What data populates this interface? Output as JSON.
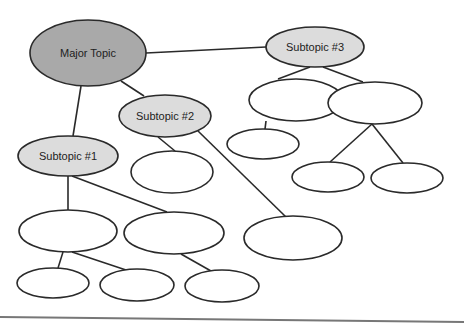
{
  "diagram": {
    "type": "concept-map",
    "colors": {
      "major_fill": "#a9a9a9",
      "subtopic_fill": "#dcdcdc",
      "empty_fill": "#ffffff",
      "stroke": "#2a2a2a",
      "rule": "#777777"
    },
    "nodes": [
      {
        "id": "major",
        "label": "Major Topic",
        "cx": 88,
        "cy": 53,
        "rx": 58,
        "ry": 33,
        "kind": "major"
      },
      {
        "id": "sub3",
        "label": "Subtopic #3",
        "cx": 315,
        "cy": 47,
        "rx": 49,
        "ry": 20,
        "kind": "subtopic"
      },
      {
        "id": "sub2",
        "label": "Subtopic #2",
        "cx": 165,
        "cy": 116,
        "rx": 46,
        "ry": 21,
        "kind": "subtopic"
      },
      {
        "id": "sub1",
        "label": "Subtopic #1",
        "cx": 68,
        "cy": 156,
        "rx": 50,
        "ry": 20,
        "kind": "subtopic"
      },
      {
        "id": "s3a",
        "label": "",
        "cx": 296,
        "cy": 100,
        "rx": 47,
        "ry": 21,
        "kind": "empty"
      },
      {
        "id": "s3b",
        "label": "",
        "cx": 375,
        "cy": 103,
        "rx": 47,
        "ry": 21,
        "kind": "empty"
      },
      {
        "id": "s3a1",
        "label": "",
        "cx": 263,
        "cy": 144,
        "rx": 36,
        "ry": 15,
        "kind": "empty"
      },
      {
        "id": "s3b1",
        "label": "",
        "cx": 328,
        "cy": 177,
        "rx": 36,
        "ry": 15,
        "kind": "empty"
      },
      {
        "id": "s3b2",
        "label": "",
        "cx": 407,
        "cy": 178,
        "rx": 36,
        "ry": 15,
        "kind": "empty"
      },
      {
        "id": "s2a",
        "label": "",
        "cx": 172,
        "cy": 172,
        "rx": 41,
        "ry": 21,
        "kind": "empty"
      },
      {
        "id": "s2b",
        "label": "",
        "cx": 293,
        "cy": 238,
        "rx": 49,
        "ry": 22,
        "kind": "empty"
      },
      {
        "id": "s1a",
        "label": "",
        "cx": 68,
        "cy": 231,
        "rx": 49,
        "ry": 21,
        "kind": "empty"
      },
      {
        "id": "s1b",
        "label": "",
        "cx": 174,
        "cy": 233,
        "rx": 50,
        "ry": 21,
        "kind": "empty"
      },
      {
        "id": "s1a1",
        "label": "",
        "cx": 53,
        "cy": 283,
        "rx": 36,
        "ry": 15,
        "kind": "empty"
      },
      {
        "id": "s1a2",
        "label": "",
        "cx": 137,
        "cy": 285,
        "rx": 37,
        "ry": 16,
        "kind": "empty"
      },
      {
        "id": "s1b1",
        "label": "",
        "cx": 222,
        "cy": 286,
        "rx": 37,
        "ry": 16,
        "kind": "empty"
      }
    ],
    "edges": [
      {
        "from": "major",
        "to": "sub3",
        "x1": 146,
        "y1": 53,
        "x2": 266,
        "y2": 47
      },
      {
        "from": "major",
        "to": "sub2",
        "x1": 121,
        "y1": 81,
        "x2": 144,
        "y2": 96
      },
      {
        "from": "major",
        "to": "sub1",
        "x1": 81,
        "y1": 86,
        "x2": 73,
        "y2": 136
      },
      {
        "from": "sub3",
        "to": "s3a",
        "x1": 310,
        "y1": 67,
        "x2": 278,
        "y2": 79
      },
      {
        "from": "sub3",
        "to": "s3b",
        "x1": 323,
        "y1": 67,
        "x2": 363,
        "y2": 82
      },
      {
        "from": "s3a",
        "to": "s3a1",
        "x1": 266,
        "y1": 121,
        "x2": 265,
        "y2": 129
      },
      {
        "from": "s3b",
        "to": "s3b1",
        "x1": 372,
        "y1": 124,
        "x2": 330,
        "y2": 162
      },
      {
        "from": "s3b",
        "to": "s3b2",
        "x1": 372,
        "y1": 124,
        "x2": 403,
        "y2": 163
      },
      {
        "from": "sub2",
        "to": "s2a",
        "x1": 158,
        "y1": 137,
        "x2": 175,
        "y2": 151
      },
      {
        "from": "sub2",
        "to": "s2b",
        "x1": 198,
        "y1": 131,
        "x2": 286,
        "y2": 217
      },
      {
        "from": "sub1",
        "to": "s1a",
        "x1": 68,
        "y1": 176,
        "x2": 68,
        "y2": 210
      },
      {
        "from": "sub1",
        "to": "s1b",
        "x1": 72,
        "y1": 176,
        "x2": 167,
        "y2": 212
      },
      {
        "from": "s1a",
        "to": "s1a1",
        "x1": 63,
        "y1": 252,
        "x2": 58,
        "y2": 268
      },
      {
        "from": "s1a",
        "to": "s1a2",
        "x1": 72,
        "y1": 252,
        "x2": 126,
        "y2": 270
      },
      {
        "from": "s1b",
        "to": "s1b1",
        "x1": 181,
        "y1": 254,
        "x2": 211,
        "y2": 271
      }
    ],
    "rule": {
      "x1": 0,
      "y1": 317,
      "x2": 464,
      "y2": 322
    }
  }
}
